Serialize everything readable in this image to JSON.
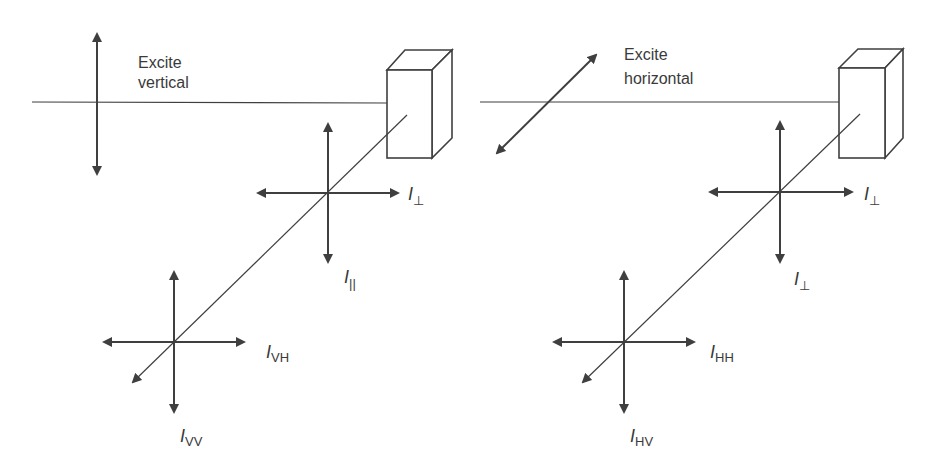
{
  "diagram": {
    "title": "",
    "colors": {
      "stroke": "#3f3f3f",
      "text": "#3a3a3a",
      "background": "#ffffff"
    },
    "panels": [
      {
        "id": "left",
        "excitation_label_line1": "Excite",
        "excitation_label_line2": "vertical",
        "polarization": "vertical",
        "near_cross": {
          "right_label": {
            "symbol": "I",
            "subscript": "⊥"
          },
          "bottom_label": {
            "symbol": "I",
            "subscript": "||"
          }
        },
        "far_cross": {
          "right_label": {
            "symbol": "I",
            "subscript": "VH"
          },
          "bottom_label": {
            "symbol": "I",
            "subscript": "VV"
          }
        }
      },
      {
        "id": "right",
        "excitation_label_line1": "Excite",
        "excitation_label_line2": "horizontal",
        "polarization": "horizontal (diagonal in perspective)",
        "near_cross": {
          "right_label": {
            "symbol": "I",
            "subscript": "⊥"
          },
          "bottom_label": {
            "symbol": "I",
            "subscript": "⊥"
          }
        },
        "far_cross": {
          "right_label": {
            "symbol": "I",
            "subscript": "HH"
          },
          "bottom_label": {
            "symbol": "I",
            "subscript": "HV"
          }
        }
      }
    ]
  }
}
